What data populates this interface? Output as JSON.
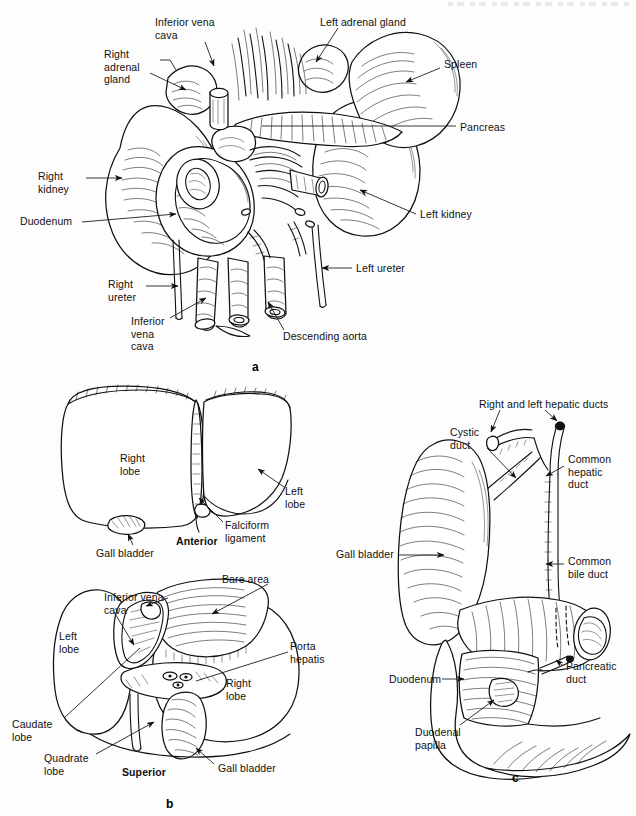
{
  "plate": {
    "width": 636,
    "height": 816,
    "background": "#ffffff",
    "ink": "#101010"
  },
  "panels": [
    {
      "id": "a",
      "letter": "a",
      "title": "Kidneys, adrenal glands, pancreas and spleen in situ",
      "letter_pos": {
        "x": 252,
        "y": 360
      },
      "labels": [
        {
          "name": "inferior-vena-cava-top",
          "text": "Inferior vena\ncava",
          "x": 155,
          "y": 16,
          "align": "left"
        },
        {
          "name": "left-adrenal-gland",
          "text": "Left adrenal gland",
          "x": 320,
          "y": 16,
          "align": "left"
        },
        {
          "name": "right-adrenal-gland",
          "text": "Right\nadrenal\ngland",
          "x": 104,
          "y": 48,
          "align": "left"
        },
        {
          "name": "spleen",
          "text": "Spleen",
          "x": 444,
          "y": 58,
          "align": "left"
        },
        {
          "name": "pancreas",
          "text": "Pancreas",
          "x": 460,
          "y": 121,
          "align": "left"
        },
        {
          "name": "right-kidney",
          "text": "Right\nkidney",
          "x": 38,
          "y": 170,
          "align": "left"
        },
        {
          "name": "left-kidney",
          "text": "Left kidney",
          "x": 420,
          "y": 208,
          "align": "left"
        },
        {
          "name": "duodenum",
          "text": "Duodenum",
          "x": 20,
          "y": 215,
          "align": "left"
        },
        {
          "name": "left-ureter",
          "text": "Left ureter",
          "x": 356,
          "y": 262,
          "align": "left"
        },
        {
          "name": "right-ureter",
          "text": "Right\nureter",
          "x": 108,
          "y": 278,
          "align": "left"
        },
        {
          "name": "inferior-vena-cava-bottom",
          "text": "Inferior\nvena\ncava",
          "x": 131,
          "y": 315,
          "align": "left"
        },
        {
          "name": "descending-aorta",
          "text": "Descending aorta",
          "x": 283,
          "y": 330,
          "align": "left"
        }
      ]
    },
    {
      "id": "b",
      "letter": "b",
      "title": "Liver, anterior and superior views",
      "letter_pos": {
        "x": 166,
        "y": 797
      },
      "labels": [
        {
          "name": "right-lobe-anterior",
          "text": "Right\nlobe",
          "x": 120,
          "y": 452,
          "align": "left"
        },
        {
          "name": "left-lobe-anterior",
          "text": "Left\nlobe",
          "x": 285,
          "y": 485,
          "align": "left"
        },
        {
          "name": "falciform-ligament",
          "text": "Falciform\nligament",
          "x": 225,
          "y": 519,
          "align": "left"
        },
        {
          "name": "anterior-view-caption",
          "text": "Anterior",
          "x": 176,
          "y": 535,
          "align": "left",
          "bold": true
        },
        {
          "name": "gall-bladder-anterior",
          "text": "Gall bladder",
          "x": 96,
          "y": 547,
          "align": "left"
        },
        {
          "name": "bare-area",
          "text": "Bare area",
          "x": 222,
          "y": 573,
          "align": "left"
        },
        {
          "name": "inferior-vena-cava-superior",
          "text": "Inferior vena\ncava",
          "x": 104,
          "y": 591,
          "align": "left"
        },
        {
          "name": "left-lobe-superior",
          "text": "Left\nlobe",
          "x": 59,
          "y": 630,
          "align": "left"
        },
        {
          "name": "porta-hepatis",
          "text": "Porta\nhepatis",
          "x": 290,
          "y": 640,
          "align": "left"
        },
        {
          "name": "right-lobe-superior",
          "text": "Right\nlobe",
          "x": 226,
          "y": 677,
          "align": "left"
        },
        {
          "name": "caudate-lobe",
          "text": "Caudate\nlobe",
          "x": 12,
          "y": 718,
          "align": "left"
        },
        {
          "name": "quadrate-lobe",
          "text": "Quadrate\nlobe",
          "x": 44,
          "y": 752,
          "align": "left"
        },
        {
          "name": "superior-view-caption",
          "text": "Superior",
          "x": 122,
          "y": 766,
          "align": "left",
          "bold": true
        },
        {
          "name": "gall-bladder-superior",
          "text": "Gall bladder",
          "x": 218,
          "y": 762,
          "align": "left"
        }
      ]
    },
    {
      "id": "c",
      "letter": "c",
      "title": "Gall bladder and biliary ducts",
      "letter_pos": {
        "x": 512,
        "y": 771
      },
      "labels": [
        {
          "name": "right-and-left-hepatic-ducts",
          "text": "Right and left hepatic ducts",
          "x": 479,
          "y": 398,
          "align": "left"
        },
        {
          "name": "cystic-duct",
          "text": "Cystic\nduct",
          "x": 450,
          "y": 426,
          "align": "left"
        },
        {
          "name": "common-hepatic-duct",
          "text": "Common\nhepatic\nduct",
          "x": 568,
          "y": 453,
          "align": "left"
        },
        {
          "name": "gall-bladder-c",
          "text": "Gall bladder",
          "x": 336,
          "y": 548,
          "align": "left"
        },
        {
          "name": "common-bile-duct",
          "text": "Common\nbile duct",
          "x": 568,
          "y": 555,
          "align": "left"
        },
        {
          "name": "pancreatic-duct",
          "text": "Pancreatic\nduct",
          "x": 566,
          "y": 660,
          "align": "left"
        },
        {
          "name": "duodenum-c",
          "text": "Duodenum",
          "x": 389,
          "y": 673,
          "align": "left"
        },
        {
          "name": "duodenal-papilla",
          "text": "Duodenal\npapilla",
          "x": 415,
          "y": 726,
          "align": "left"
        }
      ]
    }
  ]
}
